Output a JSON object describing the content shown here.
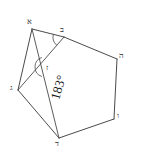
{
  "figure": {
    "stroke_color": "#4a4a4a",
    "label_color": "#2b2b2b",
    "background": "#ffffff",
    "annotation": {
      "value": "183°",
      "rotation_deg": -74
    },
    "vertices": [
      {
        "id": "A",
        "label": "א",
        "x": 32,
        "y": 29,
        "lx": 27,
        "ly": 18
      },
      {
        "id": "B",
        "label": "ב",
        "x": 64,
        "y": 37,
        "lx": 60,
        "ly": 26
      },
      {
        "id": "C",
        "label": "ה",
        "x": 117,
        "y": 59,
        "lx": 119,
        "ly": 52
      },
      {
        "id": "D",
        "label": "ו",
        "x": 114,
        "y": 119,
        "lx": 117,
        "ly": 112
      },
      {
        "id": "E",
        "label": "ד",
        "x": 59,
        "y": 138,
        "lx": 55,
        "ly": 140
      },
      {
        "id": "F",
        "label": "ג",
        "x": 18,
        "y": 90,
        "lx": 10,
        "ly": 84
      },
      {
        "id": "G",
        "label": "ז",
        "x": 45,
        "y": 67,
        "lx": 46,
        "ly": 64
      }
    ],
    "edges": [
      {
        "from": "A",
        "to": "B",
        "kind": "side"
      },
      {
        "from": "B",
        "to": "C",
        "kind": "side"
      },
      {
        "from": "C",
        "to": "D",
        "kind": "side"
      },
      {
        "from": "D",
        "to": "E",
        "kind": "side"
      },
      {
        "from": "E",
        "to": "F",
        "kind": "side"
      },
      {
        "from": "F",
        "to": "A",
        "kind": "side"
      },
      {
        "from": "A",
        "to": "E",
        "kind": "diagonal"
      },
      {
        "from": "B",
        "to": "F",
        "kind": "diagonal"
      }
    ],
    "arcs": [
      {
        "id": "arc-at-B",
        "cx": 64,
        "cy": 37,
        "r": 11,
        "start_deg": 132,
        "end_deg": 196
      },
      {
        "id": "arc-at-G",
        "cx": 45,
        "cy": 67,
        "r": 10,
        "start_deg": 108,
        "end_deg": 252
      }
    ]
  }
}
